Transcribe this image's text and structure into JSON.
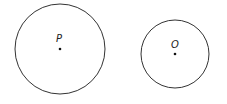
{
  "diagram": {
    "type": "two-circles",
    "circles": [
      {
        "label": "P",
        "cx": 60,
        "cy": 49,
        "r": 45
      },
      {
        "label": "O",
        "cx": 175,
        "cy": 54,
        "r": 34
      }
    ],
    "stroke_color": "#333333"
  }
}
